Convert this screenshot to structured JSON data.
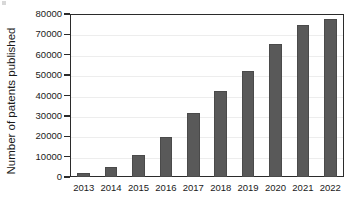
{
  "chart_data": {
    "type": "bar",
    "title": "",
    "xlabel": "",
    "ylabel": "Number of patents published",
    "categories": [
      "2013",
      "2014",
      "2015",
      "2016",
      "2017",
      "2018",
      "2019",
      "2020",
      "2021",
      "2022"
    ],
    "values": [
      2200,
      5000,
      11000,
      19600,
      31600,
      42000,
      52000,
      65500,
      74500,
      77500
    ],
    "ylim": [
      0,
      80000
    ],
    "ytick_values": [
      0,
      10000,
      20000,
      30000,
      40000,
      50000,
      60000,
      70000,
      80000
    ],
    "ytick_labels": [
      "0",
      "10000",
      "20000",
      "30000",
      "40000",
      "50000",
      "60000",
      "70000",
      "80000"
    ],
    "grid": true,
    "legend": null,
    "series": [
      {
        "name": "Number of patents published",
        "color": "#595959",
        "values": [
          2200,
          5000,
          11000,
          19600,
          31600,
          42000,
          52000,
          65500,
          74500,
          77500
        ]
      }
    ],
    "colors": {
      "bar": "#595959",
      "bar_edge": "#4a4a4a",
      "axis": "#2b2b2b",
      "grid": "#ededed",
      "text": "#1a1a1a",
      "background": "#ffffff"
    }
  }
}
